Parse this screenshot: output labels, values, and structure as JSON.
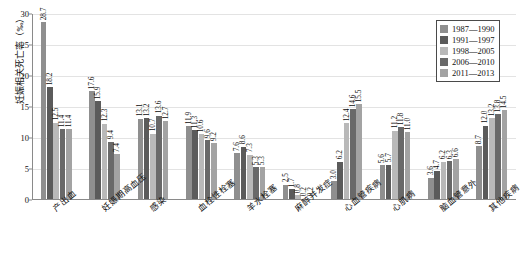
{
  "chart_data": {
    "type": "bar",
    "title": "",
    "subtitle": "",
    "xlabel": "",
    "ylabel": "妊娠相关死亡率（‰）",
    "ylim": [
      0,
      30
    ],
    "ytick_step": 5,
    "yticks": [
      "0",
      "5",
      "10",
      "15",
      "20",
      "25",
      "30"
    ],
    "grid": true,
    "legend_position": "top-right",
    "categories": [
      "产出血",
      "妊娠期高血压",
      "感染",
      "血栓性栓塞",
      "羊水栓塞",
      "麻醉并发症",
      "心血管疾病",
      "心肌病",
      "脑血管意外",
      "其他疾病"
    ],
    "series": [
      {
        "name": "1987—1990",
        "color": "#8f8f8f",
        "values": [
          28.7,
          17.6,
          13.1,
          11.9,
          7.6,
          2.5,
          3.0,
          5.6,
          3.6,
          8.7
        ]
      },
      {
        "name": "1991—1997",
        "color": "#5b5b5b",
        "values": [
          18.2,
          15.9,
          13.2,
          11.3,
          8.6,
          1.7,
          6.2,
          5.7,
          4.7,
          12.0
        ]
      },
      {
        "name": "1998—2005",
        "color": "#b9b9b9",
        "values": [
          12.5,
          12.3,
          10.7,
          10.6,
          7.3,
          0.8,
          12.4,
          11.2,
          6.2,
          13.2
        ]
      },
      {
        "name": "2006—2010",
        "color": "#696969",
        "values": [
          11.4,
          9.4,
          13.6,
          9.6,
          5.3,
          0.2,
          14.6,
          11.8,
          6.3,
          13.8
        ]
      },
      {
        "name": "2011—2013",
        "color": "#a3a3a3",
        "values": [
          11.4,
          7.4,
          12.7,
          9.2,
          5.3,
          0.2,
          15.5,
          11.0,
          6.6,
          14.5
        ]
      }
    ]
  }
}
